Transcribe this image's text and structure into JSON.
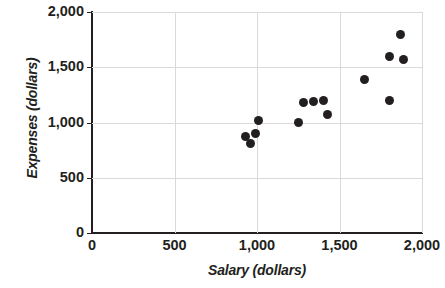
{
  "chart_data": {
    "type": "scatter",
    "title": "",
    "xlabel": "Salary (dollars)",
    "ylabel": "Expenses  (dollars)",
    "xlim": [
      0,
      2000
    ],
    "ylim": [
      0,
      2000
    ],
    "xticks": [
      0,
      500,
      1000,
      1500,
      2000
    ],
    "yticks": [
      0,
      500,
      1000,
      1500,
      2000
    ],
    "xtick_labels": [
      "0",
      "500",
      "1,000",
      "1,500",
      "2,000"
    ],
    "ytick_labels": [
      "0",
      "500",
      "1,000",
      "1,500",
      "2,000"
    ],
    "grid": true,
    "legend": null,
    "marker_color": "#231f20",
    "axis_color": "#231f20",
    "grid_color": "#d9d9d9",
    "points": [
      {
        "x": 930,
        "y": 875
      },
      {
        "x": 960,
        "y": 810
      },
      {
        "x": 990,
        "y": 900
      },
      {
        "x": 1010,
        "y": 1020
      },
      {
        "x": 1250,
        "y": 1000
      },
      {
        "x": 1280,
        "y": 1180
      },
      {
        "x": 1340,
        "y": 1190
      },
      {
        "x": 1400,
        "y": 1200
      },
      {
        "x": 1430,
        "y": 1070
      },
      {
        "x": 1650,
        "y": 1390
      },
      {
        "x": 1800,
        "y": 1200
      },
      {
        "x": 1800,
        "y": 1600
      },
      {
        "x": 1870,
        "y": 1800
      },
      {
        "x": 1890,
        "y": 1570
      }
    ]
  }
}
